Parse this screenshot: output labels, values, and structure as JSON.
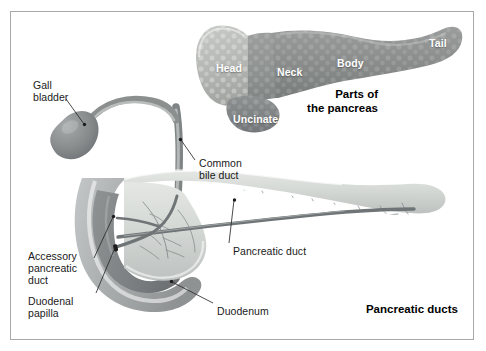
{
  "figure": {
    "background_color": "#ffffff",
    "border_color": "#a9a9ab"
  },
  "panels": [
    {
      "name": "parts-of-the-pancreas",
      "title": "Parts of\nthe pancreas",
      "organ_labels": [
        {
          "name": "head",
          "text": "Head"
        },
        {
          "name": "neck",
          "text": "Neck"
        },
        {
          "name": "body",
          "text": "Body"
        },
        {
          "name": "tail",
          "text": "Tail"
        },
        {
          "name": "uncinate",
          "text": "Uncinate"
        }
      ]
    },
    {
      "name": "pancreatic-ducts",
      "title": "Pancreatic ducts",
      "callout_labels": [
        {
          "name": "gall-bladder",
          "text": "Gall\nbladder"
        },
        {
          "name": "common-bile-duct",
          "text": "Common\nbile duct"
        },
        {
          "name": "accessory-pancreatic-duct",
          "text": "Accessory\npancreatic\nduct"
        },
        {
          "name": "duodenal-papilla",
          "text": "Duodenal\npapilla"
        },
        {
          "name": "pancreatic-duct",
          "text": "Pancreatic duct"
        },
        {
          "name": "duodenum",
          "text": "Duodenum"
        }
      ]
    }
  ],
  "colors": {
    "head": "#b9bbb8",
    "neck": "#8e9190",
    "body": "#8a8d8c",
    "tail": "#9a9d9c",
    "uncinate": "#7e8180",
    "gall_bladder": "#86898a",
    "bile_duct": "#9ba09e",
    "duodenum_outer": "#b7bbbb",
    "duodenum_wall": "#8d9192",
    "pancreas_body_light": "#d9dcda",
    "duct_dark": "#6f7476",
    "label_text": "#1a1a1a",
    "organ_label_text": "#ffffff"
  }
}
